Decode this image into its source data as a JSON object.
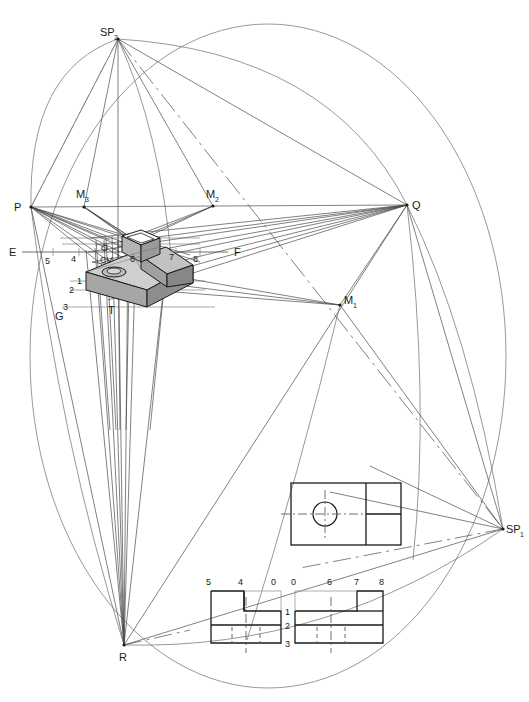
{
  "drawing": {
    "title": "Perspective projection construction with measuring points",
    "type": "engineering-perspective-layout",
    "background_color": "#ffffff",
    "line_color": "#555555",
    "heavy_line_color": "#1a1a1a",
    "object_fill": "#b9b9b9"
  },
  "station_points": [
    {
      "id": "SP2",
      "base": "SP",
      "sub": "2",
      "x": 118,
      "y": 39,
      "label_x": 100,
      "label_y": 36
    },
    {
      "id": "SP1",
      "base": "SP",
      "sub": "1",
      "x": 503,
      "y": 529,
      "label_x": 506,
      "label_y": 533
    }
  ],
  "vanishing_points": [
    {
      "id": "P",
      "label": "P",
      "x": 31,
      "y": 207,
      "label_x": 14,
      "label_y": 211
    },
    {
      "id": "Q",
      "label": "Q",
      "x": 407,
      "y": 205,
      "label_x": 412,
      "label_y": 209
    },
    {
      "id": "R",
      "label": "R",
      "x": 124,
      "y": 645,
      "label_x": 119,
      "label_y": 661
    }
  ],
  "measuring_points": [
    {
      "id": "M1",
      "base": "M",
      "sub": "1",
      "x": 340,
      "y": 305,
      "label_x": 344,
      "label_y": 304
    },
    {
      "id": "M2",
      "base": "M",
      "sub": "2",
      "x": 213,
      "y": 206,
      "label_x": 206,
      "label_y": 198
    },
    {
      "id": "M3",
      "base": "M",
      "sub": "3",
      "x": 84,
      "y": 207,
      "label_x": 76,
      "label_y": 198
    }
  ],
  "ground_line": {
    "left_label": "E",
    "right_label": "F",
    "left_x": 12,
    "right_x": 238,
    "y": 252,
    "line_x1": 22,
    "line_x2": 228
  },
  "auxiliary_labels": [
    {
      "text": "G",
      "x": 58,
      "y": 318
    },
    {
      "text": "T",
      "x": 111,
      "y": 312
    },
    {
      "text": "O",
      "x": 103,
      "y": 250
    },
    {
      "text": "CV",
      "x": 104,
      "y": 261
    }
  ],
  "scale_marks": [
    {
      "text": "5",
      "x": 48,
      "y": 262
    },
    {
      "text": "4",
      "x": 74,
      "y": 260
    },
    {
      "text": "6",
      "x": 133,
      "y": 260
    },
    {
      "text": "7",
      "x": 172,
      "y": 258
    },
    {
      "text": "8",
      "x": 196,
      "y": 260
    },
    {
      "text": "1",
      "x": 79,
      "y": 281
    },
    {
      "text": "2",
      "x": 72,
      "y": 290
    },
    {
      "text": "3",
      "x": 66,
      "y": 307
    }
  ],
  "top_view": {
    "name": "top-view",
    "x": 291,
    "y": 483,
    "width": 110,
    "height": 62,
    "divider_x": 366,
    "mid_y": 514,
    "circle": {
      "cx": 325,
      "cy": 514,
      "r": 12
    },
    "centerline_h": {
      "x1": 281,
      "x2": 369,
      "y": 514
    },
    "centerline_v": {
      "y1": 490,
      "y2": 540,
      "x": 325
    }
  },
  "front_view": {
    "name": "front-view",
    "x": 211,
    "y": 591,
    "width": 70,
    "height": 52,
    "top_labels": [
      {
        "text": "5",
        "x": 209,
        "y": 584
      },
      {
        "text": "4",
        "x": 240,
        "y": 584
      },
      {
        "text": "0",
        "x": 273,
        "y": 584
      }
    ],
    "side_labels": [
      {
        "text": "1",
        "x": 284,
        "y": 613
      },
      {
        "text": "2",
        "x": 284,
        "y": 627
      },
      {
        "text": "3",
        "x": 284,
        "y": 645
      }
    ],
    "step_x": 244,
    "step_y": 611,
    "shelf_y": 625,
    "centerline_x": 246,
    "hidden_lines_x": [
      232,
      246,
      260
    ],
    "hidden_y1": 627,
    "hidden_y2": 643
  },
  "side_view": {
    "name": "side-view",
    "x": 295,
    "y": 591,
    "width": 88,
    "height": 52,
    "top_labels": [
      {
        "text": "0",
        "x": 293,
        "y": 584
      },
      {
        "text": "6",
        "x": 329,
        "y": 584
      },
      {
        "text": "7",
        "x": 356,
        "y": 584
      },
      {
        "text": "8",
        "x": 381,
        "y": 584
      }
    ],
    "step_x": 357,
    "step_y": 611,
    "shelf_y": 625,
    "centerline_x": 331,
    "hidden_lines_x": [
      317,
      331,
      345
    ],
    "hidden_y1": 627,
    "hidden_y2": 643
  },
  "object_3d": {
    "name": "perspective-block",
    "description": "L-shaped block with counterbored hole and upstand, drawn in two-point perspective",
    "fill_top": "#c9c9c9",
    "fill_front": "#a8a8a8",
    "fill_side": "#8e8e8e"
  },
  "circles": [
    {
      "name": "main-construction-circle",
      "cx": 268,
      "cy": 356,
      "rx": 238,
      "ry": 333
    }
  ]
}
